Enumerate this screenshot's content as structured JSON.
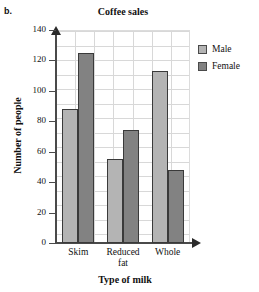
{
  "part_label": "b.",
  "chart_data": {
    "type": "bar",
    "title": "Coffee sales",
    "xlabel": "Type of milk",
    "ylabel": "Number of people",
    "categories": [
      "Skim",
      "Reduced fat",
      "Whole"
    ],
    "category_lines": [
      [
        "Skim"
      ],
      [
        "Reduced",
        "fat"
      ],
      [
        "Whole"
      ]
    ],
    "series": [
      {
        "name": "Male",
        "values": [
          88,
          55,
          113
        ],
        "color": "#b4b4b4"
      },
      {
        "name": "Female",
        "values": [
          125,
          74,
          48
        ],
        "color": "#828282"
      }
    ],
    "ylim": [
      0,
      140
    ],
    "ytick_values": [
      0,
      20,
      40,
      60,
      80,
      100,
      120,
      140
    ],
    "ytick_labels": [
      "0",
      "20",
      "40",
      "60",
      "80",
      "100",
      "120",
      "140"
    ],
    "grid": true,
    "legend_position": "right"
  }
}
